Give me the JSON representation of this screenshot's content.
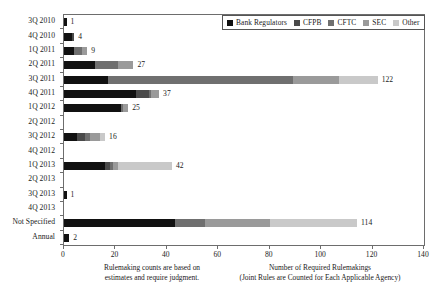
{
  "chart_data": {
    "type": "bar",
    "orientation": "horizontal",
    "stacked": true,
    "title": "",
    "xlabel": "Number of Required Rulemakings",
    "xlabel_sub": "(Joint Rules are Counted for Each Applicable Agency)",
    "ylabel": "",
    "xlim": [
      0,
      140
    ],
    "xticks": [
      0,
      20,
      40,
      60,
      80,
      100,
      120,
      140
    ],
    "xtick_labels": [
      "0",
      "20",
      "40",
      "60",
      "80",
      "100",
      "120",
      "140"
    ],
    "grid": false,
    "legend_position": "top-right",
    "legend": [
      "Bank Regulators",
      "CFPB",
      "CFTC",
      "SEC",
      "Other"
    ],
    "series_colors": [
      "#111111",
      "#4a4a4a",
      "#6f6f6f",
      "#9a9a9a",
      "#c9c9c9"
    ],
    "categories": [
      "3Q 2010",
      "4Q 2010",
      "1Q 2011",
      "2Q 2011",
      "3Q 2011",
      "4Q 2011",
      "1Q 2012",
      "2Q 2012",
      "3Q 2012",
      "4Q 2012",
      "1Q 2013",
      "2Q 2013",
      "3Q 2013",
      "4Q 2013",
      "Not Specified",
      "Annual"
    ],
    "series": [
      {
        "name": "Bank Regulators",
        "values": [
          1,
          3,
          4,
          12,
          17,
          28,
          22,
          0,
          5,
          0,
          16,
          0,
          1,
          0,
          43,
          2
        ]
      },
      {
        "name": "CFPB",
        "values": [
          0,
          1,
          0,
          0,
          0,
          5,
          0,
          0,
          3,
          0,
          2,
          0,
          0,
          0,
          0,
          0
        ]
      },
      {
        "name": "CFTC",
        "values": [
          0,
          0,
          3,
          9,
          72,
          1,
          1,
          0,
          2,
          0,
          1,
          0,
          0,
          0,
          12,
          0
        ]
      },
      {
        "name": "SEC",
        "values": [
          0,
          0,
          2,
          6,
          18,
          3,
          2,
          0,
          4,
          0,
          2,
          0,
          0,
          0,
          25,
          0
        ]
      },
      {
        "name": "Other",
        "values": [
          0,
          0,
          0,
          0,
          15,
          0,
          0,
          0,
          2,
          0,
          21,
          0,
          0,
          0,
          34,
          0
        ]
      }
    ],
    "totals": [
      1,
      4,
      9,
      27,
      122,
      37,
      25,
      0,
      16,
      0,
      42,
      0,
      1,
      0,
      114,
      2
    ],
    "total_labels": [
      "1",
      "4",
      "9",
      "27",
      "122",
      "37",
      "25",
      "",
      "16",
      "",
      "42",
      "",
      "1",
      "",
      "114",
      "2"
    ],
    "annotation_left": "Rulemaking counts are based on estimates and require judgment."
  },
  "note": {
    "line1": "Rulemaking counts are based on",
    "line2": "estimates and require judgment."
  },
  "caption": {
    "line1": "Number of Required Rulemakings",
    "line2": "(Joint Rules are Counted for Each Applicable Agency)"
  }
}
